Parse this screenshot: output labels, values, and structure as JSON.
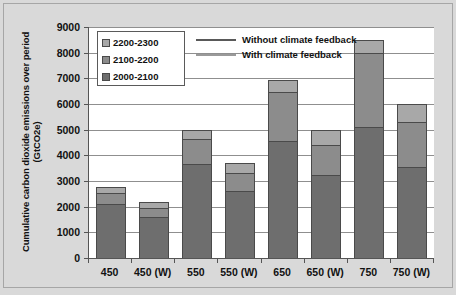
{
  "chart_data": {
    "type": "bar",
    "subtype": "stacked",
    "title": "",
    "xlabel": "",
    "ylabel": "Cumulative carbon dioxide emissions over period (GtCO2e)",
    "ylim": [
      0,
      9000
    ],
    "ytick_step": 1000,
    "yticks": [
      "9000",
      "8000",
      "7000",
      "6000",
      "5000",
      "4000",
      "3000",
      "2000",
      "1000",
      "0"
    ],
    "grid": true,
    "grid_axis": "y",
    "legend_position": "top-left-inside",
    "categories": [
      "450",
      "450 (W)",
      "550",
      "550 (W)",
      "650",
      "650 (W)",
      "750",
      "750 (W)"
    ],
    "series": [
      {
        "name": "2000-2100",
        "color": "#6e6e6e",
        "values": [
          2100,
          1600,
          3650,
          2600,
          4550,
          3250,
          5100,
          3550
        ]
      },
      {
        "name": "2100-2200",
        "color": "#8c8c8c",
        "values": [
          450,
          350,
          1000,
          700,
          1900,
          1150,
          2900,
          1750
        ]
      },
      {
        "name": "2200-2300",
        "color": "#a8a8a8",
        "values": [
          200,
          250,
          350,
          400,
          500,
          600,
          500,
          700
        ]
      }
    ],
    "totals": [
      2750,
      2200,
      5000,
      3700,
      6950,
      5000,
      8500,
      6000
    ],
    "line_legend": [
      {
        "label": "Without climate feedback",
        "color": "#595959"
      },
      {
        "label": "With climate feedback",
        "color": "#9a9a9a"
      }
    ]
  },
  "colors": {
    "figure_background": "#d9d9d9",
    "plot_background": "#ffffff",
    "axis": "#555555",
    "gridline": "#8f8f8f",
    "text": "#111111",
    "series_2000_2100": "#6e6e6e",
    "series_2100_2200": "#8c8c8c",
    "series_2200_2300": "#a8a8a8",
    "line_without_feedback": "#595959",
    "line_with_feedback": "#9a9a9a"
  }
}
